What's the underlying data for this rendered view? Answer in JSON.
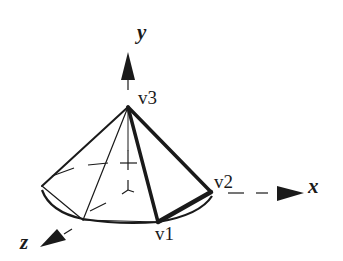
{
  "diagram": {
    "type": "3d-cone-mesh",
    "axes": {
      "x": {
        "label": "x"
      },
      "y": {
        "label": "y"
      },
      "z": {
        "label": "z"
      }
    },
    "vertices": {
      "v1": {
        "label": "v1"
      },
      "v2": {
        "label": "v2"
      },
      "v3": {
        "label": "v3"
      }
    },
    "highlighted_triangle": [
      "v1",
      "v2",
      "v3"
    ],
    "colors": {
      "stroke": "#1a1a1a",
      "background": "#ffffff"
    }
  }
}
